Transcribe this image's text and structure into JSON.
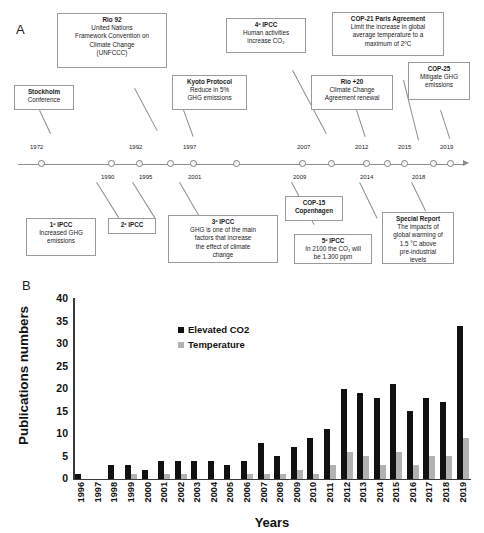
{
  "panels": {
    "a_letter": "A",
    "b_letter": "B"
  },
  "timeline": {
    "years_above": [
      "1972",
      "1992",
      "1997",
      "2007",
      "2012",
      "2015",
      "2019"
    ],
    "years_below": [
      "1990",
      "1995",
      "2001",
      "2009",
      "2014",
      "2018"
    ],
    "events_above": [
      {
        "title": "Stockholm",
        "lines": [
          "Conference"
        ]
      },
      {
        "title": "Rio 92",
        "lines": [
          "United Nations",
          "Framework Convention on",
          "Climate Change",
          "(UNFCCC)"
        ]
      },
      {
        "title": "Kyoto Protocol",
        "lines": [
          "Reduce in 5%",
          "GHG emissions"
        ]
      },
      {
        "title": "4º IPCC",
        "lines": [
          "Human activities",
          "increase CO₂"
        ]
      },
      {
        "title": "Rio +20",
        "lines": [
          "Climate Change",
          "Agreement renewal"
        ]
      },
      {
        "title": "COP-21 Paris Agreement",
        "lines": [
          "Limit the increase in global",
          "average temperature to a",
          "maximum of 2ºC"
        ]
      },
      {
        "title": "COP-25",
        "lines": [
          "Mitigate GHG",
          "emissions"
        ]
      }
    ],
    "events_below": [
      {
        "title": "1º IPCC",
        "lines": [
          "Increased GHG",
          "emissions"
        ]
      },
      {
        "title": "2º IPCC",
        "lines": []
      },
      {
        "title": "3º IPCC",
        "lines": [
          "GHG is one of the main",
          "factors that increase",
          "the effect of climate",
          "change"
        ]
      },
      {
        "title": "COP-15",
        "lines": [
          "Copenhagen"
        ]
      },
      {
        "title": "5º IPCC",
        "lines": [
          "In 2100 the CO₂ will",
          "be 1.300 ppm"
        ]
      },
      {
        "title": "Special Report",
        "lines": [
          "The impacts of",
          "global warming of",
          "1.5 °C above",
          "pre-industrial",
          "levels"
        ]
      }
    ]
  },
  "chart_data": {
    "type": "bar",
    "title": "",
    "xlabel": "Years",
    "ylabel": "Publications numbers",
    "ylim": [
      0,
      40
    ],
    "yticks": [
      0,
      5,
      10,
      15,
      20,
      25,
      30,
      35,
      40
    ],
    "grid": false,
    "legend_position": "top-left",
    "categories": [
      "1996",
      "1997",
      "1998",
      "1999",
      "2000",
      "2001",
      "2002",
      "2003",
      "2004",
      "2005",
      "2006",
      "2007",
      "2008",
      "2009",
      "2010",
      "2011",
      "2012",
      "2013",
      "2014",
      "2015",
      "2016",
      "2017",
      "2018",
      "2019"
    ],
    "series": [
      {
        "name": "Elevated CO2",
        "color": "#111111",
        "values": [
          1,
          0,
          3,
          3,
          2,
          4,
          4,
          4,
          4,
          3,
          4,
          8,
          5,
          7,
          9,
          11,
          20,
          19,
          18,
          21,
          15,
          18,
          17,
          34
        ]
      },
      {
        "name": "Temperature",
        "color": "#b2b2b2",
        "values": [
          0,
          0,
          0,
          1,
          0,
          1,
          1,
          0,
          0,
          0,
          1,
          1,
          1,
          2,
          1,
          3,
          6,
          5,
          3,
          6,
          3,
          5,
          5,
          9
        ]
      }
    ]
  }
}
